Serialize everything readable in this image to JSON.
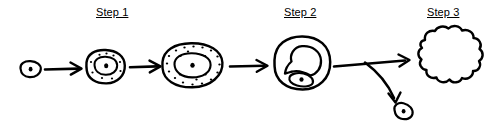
{
  "figure": {
    "background_color": "#ffffff",
    "ink_color": "#000000",
    "style": "hand-drawn line art"
  },
  "labels": [
    {
      "id": "step-1",
      "text": "Step 1",
      "underlined": true,
      "x": 96,
      "y": 6
    },
    {
      "id": "step-2",
      "text": "Step 2",
      "underlined": true,
      "x": 284,
      "y": 6
    },
    {
      "id": "step-3",
      "text": "Step 3",
      "underlined": true,
      "x": 427,
      "y": 6
    }
  ],
  "stages": [
    {
      "id": "cell-1",
      "name": "small-cell-with-nucleus",
      "description": "small oval cell with single central nucleus dot",
      "center_x": 30,
      "center_y": 70,
      "rx": 11,
      "ry": 8,
      "granule_count": 0,
      "has_nucleus_outline": false
    },
    {
      "id": "cell-2",
      "name": "enlarged-cell-with-granules",
      "description": "enlarged oval cell with nucleus outline and a few granules",
      "center_x": 105,
      "center_y": 67,
      "rx": 20,
      "ry": 17,
      "granule_count": 9,
      "has_nucleus_outline": true
    },
    {
      "id": "cell-3",
      "name": "large-granular-cell",
      "description": "large oval cell densely filled with granules around an oval nucleus",
      "center_x": 192,
      "center_y": 65,
      "rx": 30,
      "ry": 23,
      "granule_count": 22,
      "has_nucleus_outline": true
    },
    {
      "id": "cell-4",
      "name": "dividing-cell",
      "description": "round cell containing a large arc structure and a small oval body below",
      "center_x": 302,
      "center_y": 63,
      "rx": 27,
      "ry": 27,
      "granule_count": 0,
      "has_nucleus_outline": true
    },
    {
      "id": "cloud-blob",
      "name": "lobed-cloud-mass",
      "description": "irregular lobed cloud-like mass",
      "center_x": 449,
      "center_y": 57,
      "rx": 33,
      "ry": 29
    },
    {
      "id": "cell-5",
      "name": "released-small-cell",
      "description": "small tilted oval cell with central nucleus dot",
      "center_x": 404,
      "center_y": 110,
      "rx": 10,
      "ry": 7
    }
  ],
  "arrows": [
    {
      "id": "arrow-1",
      "name": "arrow-cell1-to-cell2",
      "from": "cell-1",
      "to": "cell-2",
      "x1": 45,
      "y1": 69,
      "x2": 81,
      "y2": 69,
      "shape": "straight"
    },
    {
      "id": "arrow-2",
      "name": "arrow-cell2-to-cell3",
      "from": "cell-2",
      "to": "cell-3",
      "x1": 130,
      "y1": 67,
      "x2": 160,
      "y2": 67,
      "shape": "straight"
    },
    {
      "id": "arrow-3",
      "name": "arrow-cell3-to-cell4",
      "from": "cell-3",
      "to": "cell-4",
      "x1": 226,
      "y1": 66,
      "x2": 270,
      "y2": 66,
      "shape": "straight"
    },
    {
      "id": "arrow-4",
      "name": "arrow-cell4-to-cloud",
      "from": "cell-4",
      "to": "cloud-blob",
      "x1": 331,
      "y1": 66,
      "x2": 409,
      "y2": 59,
      "shape": "straight"
    },
    {
      "id": "arrow-5",
      "name": "arrow-branch-to-small-cell",
      "from": "cell-4",
      "to": "cell-5",
      "x1": 366,
      "y1": 63,
      "x2": 397,
      "y2": 100,
      "shape": "curved"
    }
  ]
}
